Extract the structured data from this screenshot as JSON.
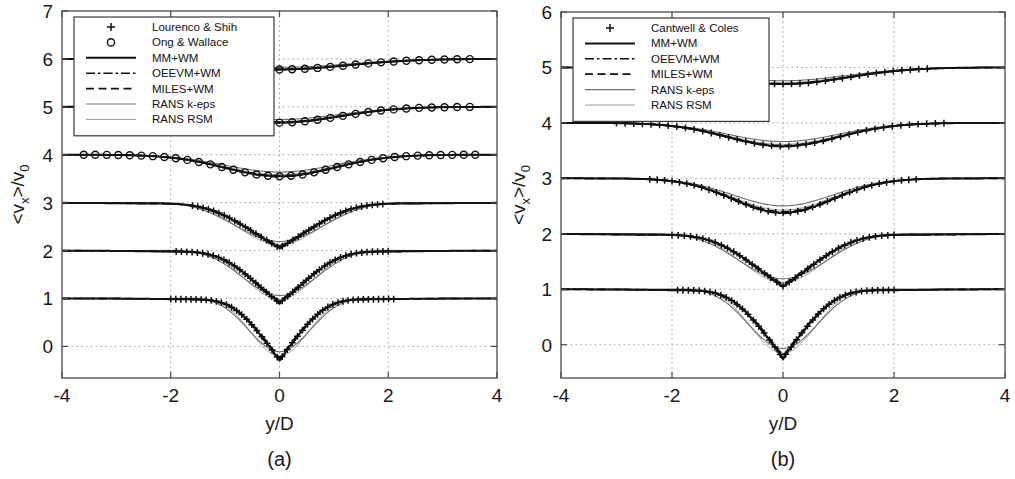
{
  "figure": {
    "background": "#ffffff",
    "ink": "#111111"
  },
  "chart_data": [
    {
      "type": "line",
      "panel_id": "a",
      "caption": "(a)",
      "title": "",
      "xlabel": "y/D",
      "ylabel": "<v_x>/v_0",
      "ylabel_parts": {
        "pre": "<v",
        "sub1": "x",
        "mid": ">/v",
        "sub2": "0"
      },
      "xlim": [
        -4,
        4
      ],
      "ylim": [
        -0.66,
        7.0
      ],
      "xticks": [
        -4,
        -2,
        0,
        2,
        4
      ],
      "xticklabels": [
        "-4",
        "-2",
        "0",
        "2",
        "4"
      ],
      "yticks": [
        0,
        1,
        2,
        3,
        4,
        5,
        6,
        7
      ],
      "yticklabels": [
        "0",
        "1",
        "2",
        "3",
        "4",
        "5",
        "6",
        "7"
      ],
      "grid": true,
      "grid_x": [
        -2,
        0,
        2
      ],
      "grid_y": [
        0,
        1,
        2,
        3,
        4,
        5,
        6
      ],
      "legend_position": "upper-left",
      "legend": [
        {
          "label": "Lourenco & Shih",
          "style": "marker-plus"
        },
        {
          "label": "Ong & Wallace",
          "style": "marker-circle"
        },
        {
          "label": "MM+WM",
          "style": "solid"
        },
        {
          "label": "OEEVM+WM",
          "style": "dashdot"
        },
        {
          "label": "MILES+WM",
          "style": "dashed"
        },
        {
          "label": "RANS k-eps",
          "style": "thin-gray"
        },
        {
          "label": "RANS RSM",
          "style": "thin-lightgray"
        }
      ],
      "profiles": [
        {
          "name": "station-1",
          "baseline": 6,
          "marker": "circle",
          "deficit": 0.22,
          "width": 1.25,
          "shape": "shallow",
          "marker_range": [
            -3.5,
            3.5
          ],
          "marker_count": 30
        },
        {
          "name": "station-2",
          "baseline": 5,
          "marker": "circle",
          "deficit": 0.33,
          "width": 1.1,
          "shape": "shallow",
          "marker_range": [
            -3.5,
            3.5
          ],
          "marker_count": 30
        },
        {
          "name": "station-3",
          "baseline": 4,
          "marker": "circle",
          "deficit": 0.45,
          "width": 0.95,
          "shape": "medium",
          "marker_range": [
            -3.6,
            3.6
          ],
          "marker_count": 34
        },
        {
          "name": "station-4",
          "baseline": 3,
          "marker": "plus",
          "deficit": 0.95,
          "width": 0.72,
          "shape": "deep",
          "marker_range": [
            -1.6,
            1.9
          ],
          "marker_count": 36
        },
        {
          "name": "station-5",
          "baseline": 2,
          "marker": "plus",
          "deficit": 1.1,
          "width": 0.6,
          "shape": "deep",
          "marker_range": [
            -1.9,
            2.0
          ],
          "marker_count": 40
        },
        {
          "name": "station-6",
          "baseline": 1,
          "marker": "plus",
          "deficit": 1.3,
          "width": 0.5,
          "shape": "deepest",
          "marker_range": [
            -2.0,
            2.1
          ],
          "marker_count": 44
        }
      ]
    },
    {
      "type": "line",
      "panel_id": "b",
      "caption": "(b)",
      "title": "",
      "xlabel": "y/D",
      "ylabel": "<v_x>/v_0",
      "ylabel_parts": {
        "pre": "<v",
        "sub1": "x",
        "mid": ">/v",
        "sub2": "0"
      },
      "xlim": [
        -4,
        4
      ],
      "ylim": [
        -0.6,
        6.0
      ],
      "xticks": [
        -4,
        -2,
        0,
        2,
        4
      ],
      "xticklabels": [
        "-4",
        "-2",
        "0",
        "2",
        "4"
      ],
      "yticks": [
        0,
        1,
        2,
        3,
        4,
        5,
        6
      ],
      "yticklabels": [
        "0",
        "1",
        "2",
        "3",
        "4",
        "5",
        "6"
      ],
      "grid": true,
      "grid_x": [
        -2,
        0,
        2
      ],
      "grid_y": [
        0,
        1,
        2,
        3,
        4,
        5
      ],
      "legend_position": "upper-left",
      "legend": [
        {
          "label": "Cantwell & Coles",
          "style": "marker-plus"
        },
        {
          "label": "MM+WM",
          "style": "solid"
        },
        {
          "label": "OEEVM+WM",
          "style": "dashdot"
        },
        {
          "label": "MILES+WM",
          "style": "dashed"
        },
        {
          "label": "RANS k-eps",
          "style": "thin-gray"
        },
        {
          "label": "RANS RSM",
          "style": "thin-lightgray"
        }
      ],
      "profiles": [
        {
          "name": "station-1",
          "baseline": 5,
          "marker": "plus",
          "deficit": 0.3,
          "width": 1.15,
          "shape": "shallow",
          "marker_range": [
            -2.6,
            2.6
          ],
          "marker_count": 34
        },
        {
          "name": "station-2",
          "baseline": 4,
          "marker": "plus",
          "deficit": 0.42,
          "width": 1.0,
          "shape": "shallow",
          "marker_range": [
            -3.0,
            2.9
          ],
          "marker_count": 38
        },
        {
          "name": "station-3",
          "baseline": 3,
          "marker": "plus",
          "deficit": 0.62,
          "width": 0.85,
          "shape": "medium",
          "marker_range": [
            -2.4,
            2.4
          ],
          "marker_count": 36
        },
        {
          "name": "station-4",
          "baseline": 2,
          "marker": "plus",
          "deficit": 0.95,
          "width": 0.7,
          "shape": "deep",
          "marker_range": [
            -2.0,
            2.0
          ],
          "marker_count": 36
        },
        {
          "name": "station-5",
          "baseline": 1,
          "marker": "plus",
          "deficit": 1.25,
          "width": 0.55,
          "shape": "deepest",
          "marker_range": [
            -1.9,
            2.0
          ],
          "marker_count": 40
        }
      ]
    }
  ]
}
